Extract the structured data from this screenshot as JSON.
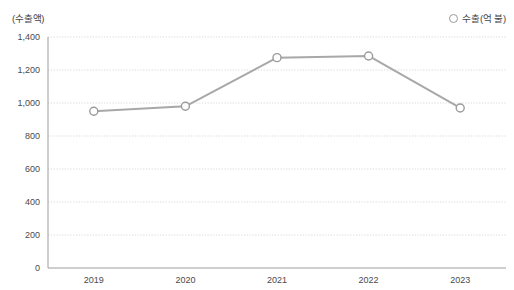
{
  "chart_data": {
    "type": "line",
    "title": "",
    "ylabel": "(수출액)",
    "xlabel": "",
    "categories": [
      "2019",
      "2020",
      "2021",
      "2022",
      "2023"
    ],
    "series": [
      {
        "name": "수출(억 불)",
        "values": [
          950,
          980,
          1275,
          1285,
          970
        ]
      }
    ],
    "ylim": [
      0,
      1400
    ],
    "ytick_labels": [
      "1,400",
      "1,200",
      "1,000",
      "800",
      "600",
      "400",
      "200",
      "0"
    ],
    "ytick_values": [
      1400,
      1200,
      1000,
      800,
      600,
      400,
      200,
      0
    ],
    "grid": true,
    "legend_position": "top-right",
    "colors": {
      "line": "#a8a8a8",
      "marker_stroke": "#9a9a9a",
      "marker_fill": "#ffffff",
      "grid": "#cfcfcf",
      "axis": "#9d9d9d",
      "text": "#4a4a4a"
    }
  },
  "legend": {
    "marker_icon": "hollow-circle-icon",
    "label": "수출(억 불)"
  }
}
